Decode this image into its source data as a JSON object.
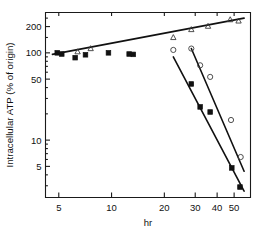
{
  "chart_data": {
    "type": "scatter",
    "title": "",
    "subtitle": "",
    "xlabel": "hr",
    "ylabel": "Intracellular ATP (% of origin)",
    "x_scale": "log",
    "y_scale": "log",
    "xlim": [
      4.2,
      62
    ],
    "ylim": [
      2.2,
      290
    ],
    "grid": false,
    "legend": "none",
    "x_ticks": [
      5,
      10,
      20,
      30,
      40,
      50
    ],
    "x_tick_labels": [
      "5",
      "10",
      "20",
      "30",
      "40",
      "50"
    ],
    "y_ticks": [
      5,
      10,
      50,
      100,
      200
    ],
    "y_tick_labels": [
      "5",
      "10",
      "50",
      "100",
      "200"
    ],
    "series": [
      {
        "name": "open-triangle-series",
        "marker": "triangle-open",
        "has_fit_line": true,
        "fit_line": {
          "x_start": 4.6,
          "y_start": 96,
          "x_end": 57,
          "y_end": 250
        },
        "points": [
          {
            "x": 6.4,
            "y": 103
          },
          {
            "x": 7.6,
            "y": 112
          },
          {
            "x": 22.5,
            "y": 150
          },
          {
            "x": 28.5,
            "y": 185
          },
          {
            "x": 35.5,
            "y": 202
          },
          {
            "x": 47.5,
            "y": 240
          },
          {
            "x": 53.0,
            "y": 232
          }
        ]
      },
      {
        "name": "open-circle-series",
        "marker": "circle-open",
        "has_fit_line": true,
        "fit_line": {
          "x_start": 28.5,
          "y_start": 112,
          "x_end": 57,
          "y_end": 4.4
        },
        "points": [
          {
            "x": 22.5,
            "y": 108
          },
          {
            "x": 28.5,
            "y": 112
          },
          {
            "x": 32.0,
            "y": 72
          },
          {
            "x": 36.5,
            "y": 53
          },
          {
            "x": 48.0,
            "y": 17
          },
          {
            "x": 54.5,
            "y": 6.4
          }
        ]
      },
      {
        "name": "filled-square-series",
        "marker": "square-filled",
        "has_fit_line": true,
        "fit_line": {
          "x_start": 22.5,
          "y_start": 90,
          "x_end": 57,
          "y_end": 2.6
        },
        "points": [
          {
            "x": 4.9,
            "y": 100
          },
          {
            "x": 5.2,
            "y": 97
          },
          {
            "x": 6.2,
            "y": 88
          },
          {
            "x": 7.1,
            "y": 95
          },
          {
            "x": 9.6,
            "y": 100
          },
          {
            "x": 12.6,
            "y": 97
          },
          {
            "x": 13.3,
            "y": 96
          },
          {
            "x": 28.5,
            "y": 44
          },
          {
            "x": 32.0,
            "y": 24
          },
          {
            "x": 36.5,
            "y": 21
          },
          {
            "x": 48.5,
            "y": 4.8
          },
          {
            "x": 54.0,
            "y": 2.9
          }
        ]
      }
    ]
  },
  "axes": {
    "x_title": "hr",
    "y_title": "Intracellular ATP (% of origin)"
  }
}
